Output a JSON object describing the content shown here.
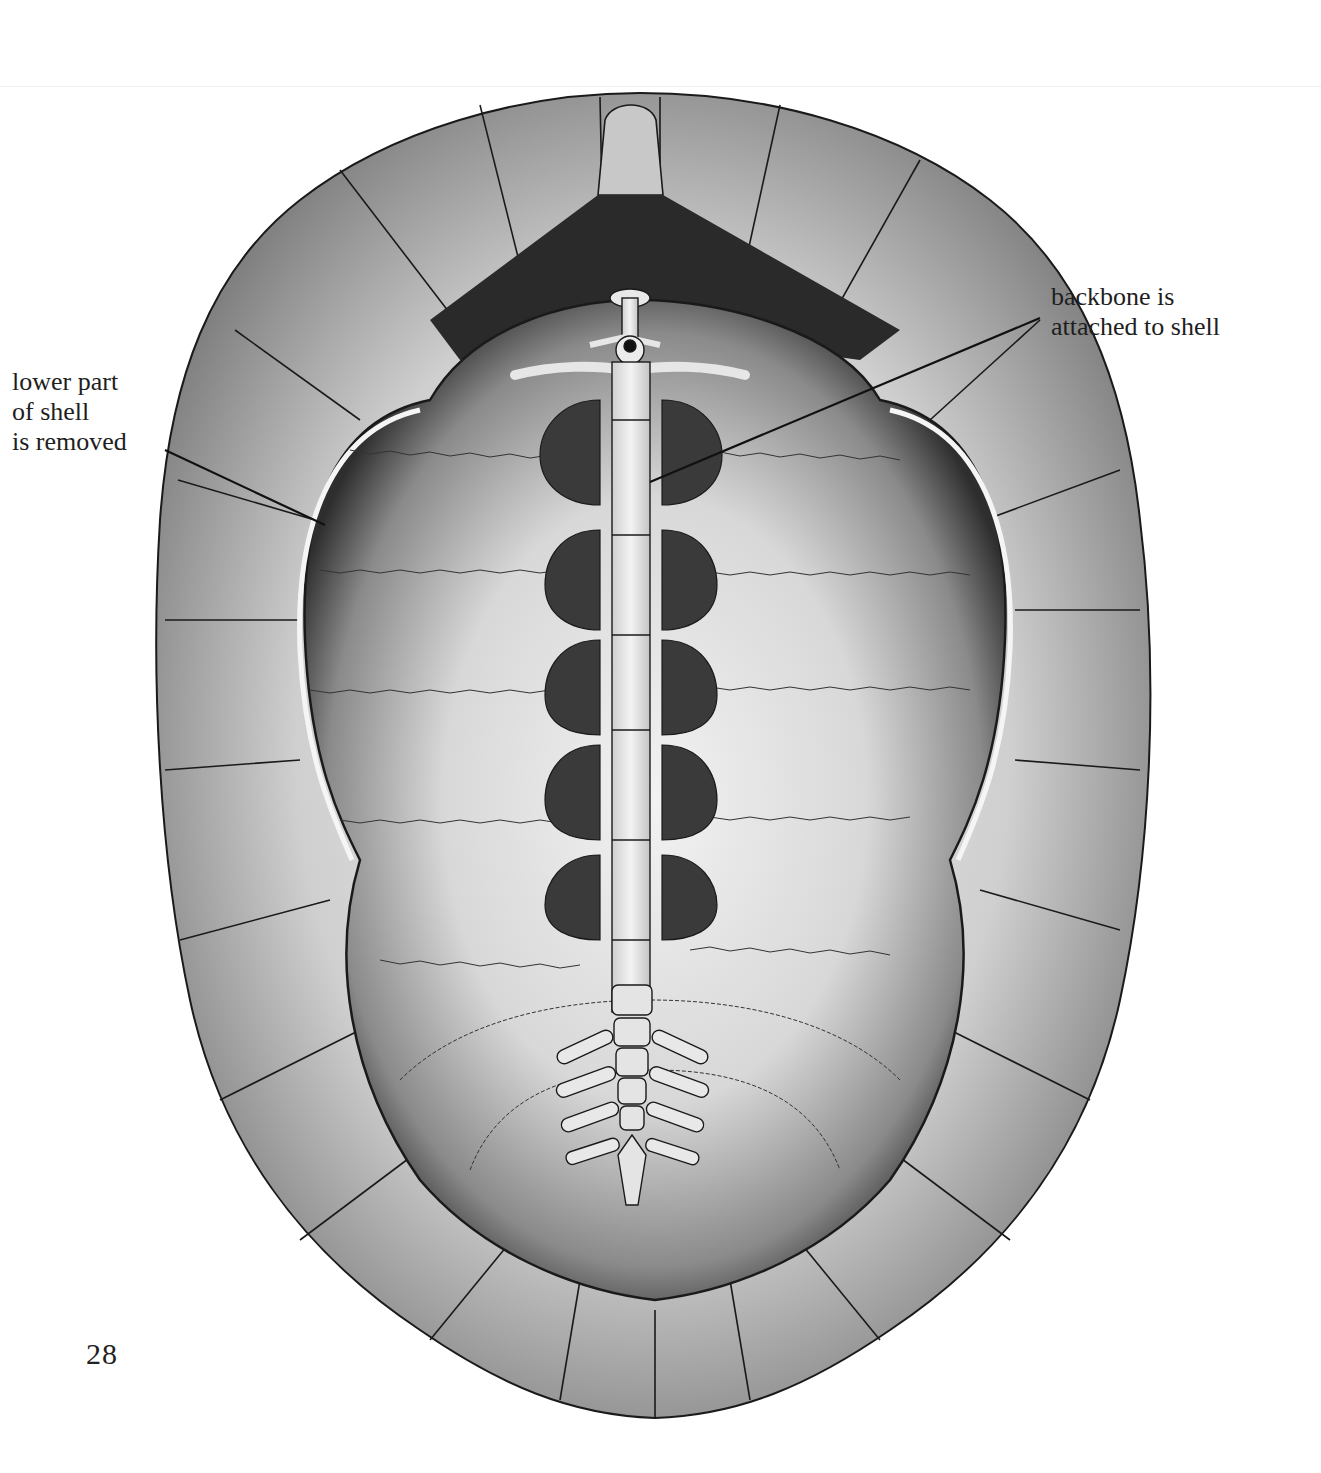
{
  "figure": {
    "labels": [
      {
        "id": "lower-shell-removed",
        "text": "lower part\nof shell\nis removed"
      },
      {
        "id": "backbone-attached",
        "text": "backbone is\nattached to shell"
      }
    ],
    "colors": {
      "ink": "#1a1a1a",
      "shell_light": "#e8e8e8",
      "shell_mid": "#b9b9b9",
      "shell_dark": "#3a3a3a",
      "background": "#ffffff"
    }
  },
  "page": {
    "number": "28"
  }
}
